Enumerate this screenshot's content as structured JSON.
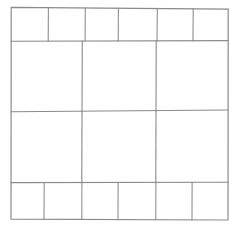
{
  "diagram": {
    "type": "grid-sketch",
    "canvas": {
      "width": 234,
      "height": 229,
      "background": "#ffffff"
    },
    "stroke": {
      "color": "#8a8a8a",
      "width": 1.15
    },
    "bounds": {
      "top_left": [
        11,
        7
      ],
      "top_right": [
        228,
        9
      ],
      "bottom_right": [
        228,
        220
      ],
      "bottom_left": [
        11,
        219
      ]
    },
    "rows": [
      {
        "name": "top-band",
        "y_top": 7,
        "y_bottom": 41,
        "cells": 6
      },
      {
        "name": "upper-middle-band",
        "y_top": 41,
        "y_bottom": 111,
        "cells": 3
      },
      {
        "name": "lower-middle-band",
        "y_top": 111,
        "y_bottom": 182,
        "cells": 3
      },
      {
        "name": "bottom-band",
        "y_top": 182,
        "y_bottom": 220,
        "cells": 6
      }
    ],
    "row_dividers_y": [
      41,
      111,
      182
    ],
    "column_dividers": {
      "top_band_x": [
        48,
        85,
        118,
        157,
        193
      ],
      "middle_bands_x": [
        82,
        156
      ],
      "bottom_band_x": [
        44,
        82,
        118,
        156,
        192
      ]
    },
    "cell_count_total": 18
  },
  "chart_data": {
    "type": "table",
    "xlabel": "",
    "ylabel": "",
    "grid": true,
    "legend": "none",
    "categories": [
      "top-band",
      "upper-middle-band",
      "lower-middle-band",
      "bottom-band"
    ],
    "values": [
      6,
      3,
      3,
      6
    ],
    "series": [
      {
        "name": "cells per row",
        "values": [
          6,
          3,
          3,
          6
        ]
      },
      {
        "name": "row height px",
        "values": [
          34,
          70,
          71,
          38
        ]
      }
    ],
    "xlim": [
      11,
      228
    ],
    "ylim": [
      7,
      220
    ]
  }
}
